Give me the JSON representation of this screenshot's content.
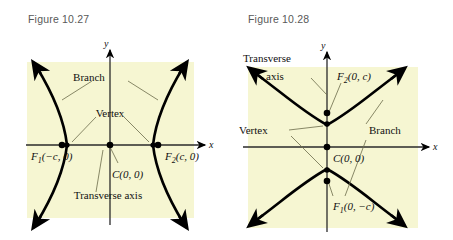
{
  "page": {
    "background": "#ffffff",
    "plot_background": "#f6f6d2",
    "curve_color": "#000000",
    "title_color": "#585858"
  },
  "figures": [
    {
      "id": "figure-10-27",
      "title": "Figure 10.27",
      "orientation": "horizontal",
      "axis_labels": {
        "x": "x",
        "y": "y"
      },
      "points": [
        {
          "name": "focus-left",
          "label": "F",
          "subscript": "1",
          "coords": "(−c, 0)"
        },
        {
          "name": "center",
          "label": "C",
          "subscript": "",
          "coords": "(0, 0)"
        },
        {
          "name": "focus-right",
          "label": "F",
          "subscript": "2",
          "coords": "(c, 0)"
        }
      ],
      "callouts": [
        {
          "name": "branch-label",
          "text": "Branch"
        },
        {
          "name": "vertex-label",
          "text": "Vertex"
        },
        {
          "name": "transverse-axis-label",
          "text": "Transverse axis"
        }
      ],
      "focus_left_label": "F",
      "focus_left_sub": "1",
      "focus_left_coords": "(−c, 0)",
      "focus_right_label": "F",
      "focus_right_sub": "2",
      "focus_right_coords": "(c, 0)",
      "center_label": "C",
      "center_coords": "(0, 0)",
      "branch_text": "Branch",
      "vertex_text": "Vertex",
      "transverse_text": "Transverse axis"
    },
    {
      "id": "figure-10-28",
      "title": "Figure 10.28",
      "orientation": "vertical",
      "axis_labels": {
        "x": "x",
        "y": "y"
      },
      "points": [
        {
          "name": "focus-upper",
          "label": "F",
          "subscript": "2",
          "coords": "(0, c)"
        },
        {
          "name": "center",
          "label": "C",
          "subscript": "",
          "coords": "(0, 0)"
        },
        {
          "name": "focus-lower",
          "label": "F",
          "subscript": "1",
          "coords": "(0, −c)"
        }
      ],
      "callouts": [
        {
          "name": "transverse-axis-label-line1",
          "text": "Transverse"
        },
        {
          "name": "transverse-axis-label-line2",
          "text": "axis"
        },
        {
          "name": "vertex-label",
          "text": "Vertex"
        },
        {
          "name": "branch-label",
          "text": "Branch"
        }
      ],
      "focus_upper_label": "F",
      "focus_upper_sub": "2",
      "focus_upper_coords": "(0, c)",
      "focus_lower_label": "F",
      "focus_lower_sub": "1",
      "focus_lower_coords": "(0, −c)",
      "center_label": "C",
      "center_coords": "(0, 0)",
      "branch_text": "Branch",
      "vertex_text": "Vertex",
      "transverse_text_1": "Transverse",
      "transverse_text_2": "axis"
    }
  ]
}
